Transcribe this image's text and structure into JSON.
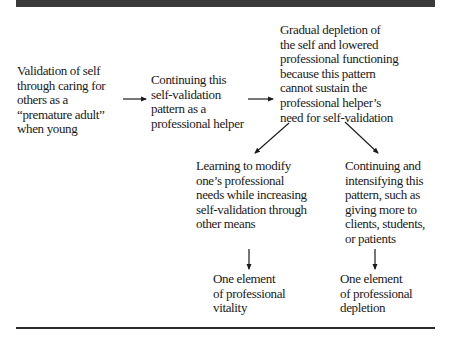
{
  "diagram": {
    "type": "flowchart",
    "colors": {
      "bar": "#3a3a3a",
      "text": "#1a1a1a",
      "arrow": "#1a1a1a"
    },
    "nodes": {
      "n1": "Validation of self\nthrough caring for\nothers as a\n“premature adult”\nwhen young",
      "n2": "Continuing this\nself-validation\npattern as a\nprofessional helper",
      "n3": "Gradual depletion of\nthe self and lowered\nprofessional functioning\nbecause this pattern\ncannot sustain the\nprofessional helper’s\nneed for self-validation",
      "n4": "Learning to modify\none’s professional\nneeds while increasing\nself-validation through\nother means",
      "n5": "Continuing and\nintensifying this\npattern, such as\ngiving more to\nclients, students,\nor patients",
      "n6": "One element\nof professional\nvitality",
      "n7": "One element\nof professional\ndepletion"
    },
    "edges": [
      {
        "from": "n1",
        "to": "n2"
      },
      {
        "from": "n2",
        "to": "n3"
      },
      {
        "from": "n3",
        "to": "n4"
      },
      {
        "from": "n3",
        "to": "n5"
      },
      {
        "from": "n4",
        "to": "n6"
      },
      {
        "from": "n5",
        "to": "n7"
      }
    ]
  }
}
